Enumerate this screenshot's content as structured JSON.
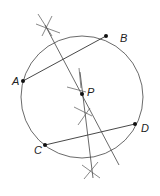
{
  "diagram": {
    "points": [
      {
        "label": "A",
        "x": 23,
        "y": 81
      },
      {
        "label": "B",
        "x": 106,
        "y": 36
      },
      {
        "label": "C",
        "x": 45,
        "y": 145
      },
      {
        "label": "D",
        "x": 135,
        "y": 124
      },
      {
        "label": "P",
        "x": 82,
        "y": 94
      }
    ],
    "circle": {
      "cx": 82,
      "cy": 97,
      "r": 61
    },
    "chords": [
      "AB",
      "CD"
    ],
    "colors": {
      "stroke": "#333333",
      "point": "#111111"
    }
  }
}
